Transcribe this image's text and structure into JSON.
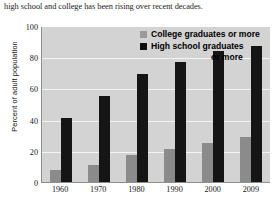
{
  "caption": "high school and college has been rising over recent decades.",
  "footer_partial": "",
  "chart_data": {
    "type": "bar",
    "title": "",
    "xlabel": "",
    "ylabel": "Percent of adult population",
    "ylim": [
      0,
      100
    ],
    "yticks": [
      100,
      80,
      60,
      40,
      20,
      0
    ],
    "grid": true,
    "legend_position": "top-center",
    "categories": [
      "1960",
      "1970",
      "1980",
      "1990",
      "2000",
      "2009"
    ],
    "series": [
      {
        "name": "College graduates or more",
        "color": "#8b8b8b",
        "values": [
          8,
          11,
          17,
          21,
          25,
          29
        ]
      },
      {
        "name": "High school graduates or more",
        "color": "#151515",
        "values": [
          41,
          55,
          69,
          77,
          84,
          87
        ]
      }
    ]
  },
  "legend": {
    "college_label": "College graduates or more",
    "hs_label_line1": "High school graduates",
    "hs_label_line2": "or more"
  }
}
